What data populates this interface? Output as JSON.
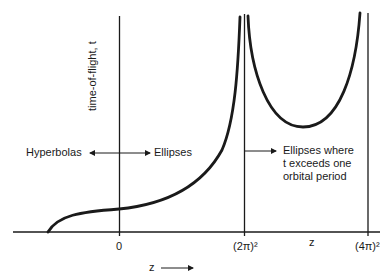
{
  "diagram": {
    "y_axis_label": "time-of-flight, t",
    "x_axis_arrow_label": "z",
    "x_axis_inline_label": "z",
    "ticks": [
      {
        "label": "0"
      },
      {
        "label": "(2π)²"
      },
      {
        "label": "(4π)²"
      }
    ],
    "regions": {
      "left": "Hyperbolas",
      "middle": "Ellipses",
      "right": "Ellipses where\nt exceeds one\norbital period"
    },
    "colors": {
      "line": "#1a1a1a",
      "background": "#ffffff"
    }
  }
}
